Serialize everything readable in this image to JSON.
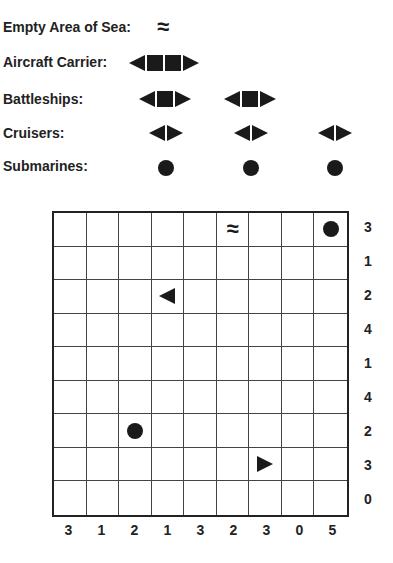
{
  "legend": {
    "empty_sea": {
      "label": "Empty Area of Sea:",
      "symbol": "≈"
    },
    "aircraft_carrier": {
      "label": "Aircraft Carrier:",
      "count": 1,
      "length": 4
    },
    "battleships": {
      "label": "Battleships:",
      "count": 2,
      "length": 3
    },
    "cruisers": {
      "label": "Cruisers:",
      "count": 3,
      "length": 2
    },
    "submarines": {
      "label": "Submarines:",
      "count": 3,
      "length": 1
    }
  },
  "grid": {
    "rows": 9,
    "cols": 9,
    "cells": [
      [
        "",
        "",
        "",
        "",
        "",
        "water",
        "",
        "",
        "sub"
      ],
      [
        "",
        "",
        "",
        "",
        "",
        "",
        "",
        "",
        ""
      ],
      [
        "",
        "",
        "",
        "left",
        "",
        "",
        "",
        "",
        ""
      ],
      [
        "",
        "",
        "",
        "",
        "",
        "",
        "",
        "",
        ""
      ],
      [
        "",
        "",
        "",
        "",
        "",
        "",
        "",
        "",
        ""
      ],
      [
        "",
        "",
        "",
        "",
        "",
        "",
        "",
        "",
        ""
      ],
      [
        "",
        "",
        "sub",
        "",
        "",
        "",
        "",
        "",
        ""
      ],
      [
        "",
        "",
        "",
        "",
        "",
        "",
        "right",
        "",
        ""
      ],
      [
        "",
        "",
        "",
        "",
        "",
        "",
        "",
        "",
        ""
      ]
    ],
    "row_clues": [
      "3",
      "1",
      "2",
      "4",
      "1",
      "4",
      "2",
      "3",
      "0"
    ],
    "col_clues": [
      "3",
      "1",
      "2",
      "1",
      "3",
      "2",
      "3",
      "0",
      "5"
    ]
  }
}
